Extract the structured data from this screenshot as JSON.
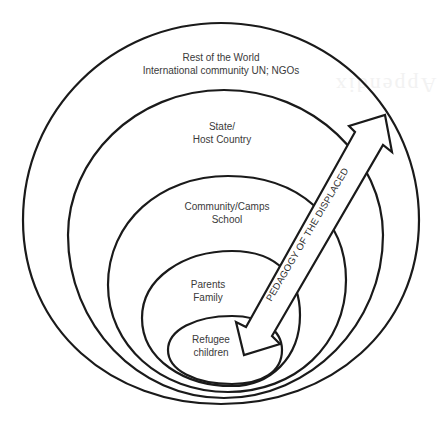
{
  "diagram": {
    "type": "nested-ecological-circles",
    "bleed_through_text": "Appendix",
    "levels": [
      {
        "id": "world",
        "lines": [
          "Rest of the World",
          "International community UN; NGOs"
        ]
      },
      {
        "id": "state",
        "lines": [
          "State/",
          "Host Country"
        ]
      },
      {
        "id": "community",
        "lines": [
          "Community/Camps",
          "School"
        ]
      },
      {
        "id": "family",
        "lines": [
          "Parents",
          "Family"
        ]
      },
      {
        "id": "children",
        "lines": [
          "Refugee",
          "children"
        ]
      }
    ],
    "arrow": {
      "label": "PEDAGOGY OF THE DISPLACED",
      "direction": "bidirectional",
      "connects": [
        "children",
        "world"
      ]
    },
    "colors": {
      "stroke": "#1a1a1a",
      "text": "#3a3a3a",
      "background": "#ffffff"
    }
  }
}
